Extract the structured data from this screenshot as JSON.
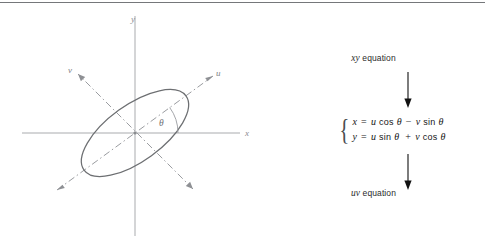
{
  "figure": {
    "diagram": {
      "axes": {
        "x_label": "x",
        "y_label": "y",
        "u_label": "u",
        "v_label": "v"
      },
      "angle_label": "θ",
      "shape": "ellipse",
      "ellipse_rotation_deg": 36,
      "origin": {
        "x": 135,
        "y": 133
      },
      "colors": {
        "axis": "#a9abae",
        "dashdot_axis": "#9a9ca0",
        "ellipse": "#6d6f72",
        "label": "#8b8d90"
      }
    },
    "flow": {
      "top_label_italic": "xy",
      "top_label_text": " equation",
      "bottom_label_italic": "uv",
      "bottom_label_text": " equation",
      "equations": [
        {
          "lhs": "x",
          "eq": "=",
          "t1_coef": "u",
          "t1_fn": "cos",
          "t1_arg": "θ",
          "op": "−",
          "t2_coef": "v",
          "t2_fn": "sin",
          "t2_arg": "θ",
          "plain": "x = u cos θ − v sin θ"
        },
        {
          "lhs": "y",
          "eq": "=",
          "t1_coef": "u",
          "t1_fn": "sin",
          "t1_arg": "θ",
          "op": "+",
          "t2_coef": "v",
          "t2_fn": "cos",
          "t2_arg": "θ",
          "plain": "y = u sin θ + v cos θ"
        }
      ],
      "arrow_direction": "down",
      "colors": {
        "arrow": "#111111",
        "text": "#161616"
      }
    }
  }
}
